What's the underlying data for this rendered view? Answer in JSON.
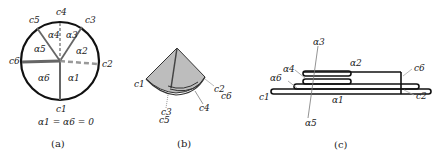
{
  "panel_a": {
    "caption": "(a)",
    "equation": "α1 = α6 = 0",
    "creases": [
      "c1",
      "c2",
      "c3",
      "c4",
      "c5",
      "c6"
    ],
    "sectors": [
      "α1",
      "α2",
      "α3",
      "α4",
      "α5",
      "α6"
    ],
    "labels": {
      "c1": "c1",
      "c2": "c2",
      "c3": "c3",
      "c4": "c4",
      "c5": "c5",
      "c6": "c6",
      "a1": "α1",
      "a2": "α2",
      "a3": "α3",
      "a4": "α4",
      "a5": "α5",
      "a6": "α6"
    }
  },
  "panel_b": {
    "caption": "(b)",
    "labels": {
      "c1": "c1",
      "c2": "c2",
      "c3": "c3",
      "c4": "c4",
      "c5": "c5",
      "c6": "c6"
    }
  },
  "panel_c": {
    "caption": "(c)",
    "labels": {
      "a1": "α1",
      "a2": "α2",
      "a3": "α3",
      "a4": "α4",
      "a5": "α5",
      "a6": "α6",
      "c1": "c1",
      "c2": "c2",
      "c6": "c6"
    }
  },
  "colors": {
    "outline": "#111111",
    "crease": "#666666",
    "fill": "#bdbdbd",
    "dashed": "#999999"
  }
}
